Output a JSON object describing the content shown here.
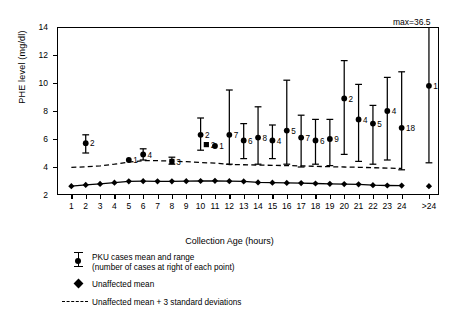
{
  "chart_data": {
    "type": "scatter",
    "title": "",
    "xlabel": "Collection Age (hours)",
    "ylabel": "PHE level (mg/dl)",
    "ylim": [
      2,
      14
    ],
    "y_ticks": [
      2,
      4,
      6,
      8,
      10,
      12,
      14
    ],
    "grid": false,
    "legend_position": "below-plot-left",
    "annotations": [
      {
        "name": "max-label",
        "text": "max=36.5",
        "x_category": ">24",
        "note": "upper range of >24 group extends to 36.5, clipped at axis top"
      }
    ],
    "categories": [
      "1",
      "2",
      "3",
      "4",
      "5",
      "6",
      "7",
      "8",
      "9",
      "10",
      "11",
      "12",
      "13",
      "14",
      "15",
      "16",
      "17",
      "18",
      "19",
      "20",
      "21",
      "22",
      "23",
      "24",
      ">24"
    ],
    "series": [
      {
        "name": "PKU cases mean and range",
        "marker": "circle-with-range-bars",
        "label_note": "number of cases at right of each point",
        "points": [
          {
            "x": "1",
            "mean": null,
            "low": null,
            "high": null,
            "n": null
          },
          {
            "x": "2",
            "mean": 5.7,
            "low": 5.0,
            "high": 6.3,
            "n": "2"
          },
          {
            "x": "3",
            "mean": null,
            "low": null,
            "high": null,
            "n": null
          },
          {
            "x": "4",
            "mean": null,
            "low": null,
            "high": null,
            "n": null
          },
          {
            "x": "5",
            "mean": 4.5,
            "low": 4.5,
            "high": 4.5,
            "n": "1"
          },
          {
            "x": "6",
            "mean": 4.9,
            "low": 4.5,
            "high": 5.3,
            "n": "4"
          },
          {
            "x": "7",
            "mean": null,
            "low": null,
            "high": null,
            "n": null
          },
          {
            "x": "8",
            "mean": 4.4,
            "low": 4.2,
            "high": 4.7,
            "n": "3",
            "marker": "square"
          },
          {
            "x": "9",
            "mean": null,
            "low": null,
            "high": null,
            "n": null
          },
          {
            "x": "10",
            "mean": 6.3,
            "low": 5.2,
            "high": 7.5,
            "n": "2"
          },
          {
            "x": "10.4",
            "mean": 5.6,
            "low": 5.6,
            "high": 5.6,
            "n": "2",
            "marker": "square"
          },
          {
            "x": "11",
            "mean": 5.5,
            "low": 5.5,
            "high": 5.5,
            "n": "1"
          },
          {
            "x": "12",
            "mean": 6.3,
            "low": 4.2,
            "high": 9.5,
            "n": "7"
          },
          {
            "x": "13",
            "mean": 5.9,
            "low": 4.6,
            "high": 7.1,
            "n": "6"
          },
          {
            "x": "14",
            "mean": 6.1,
            "low": 4.2,
            "high": 8.3,
            "n": "8"
          },
          {
            "x": "15",
            "mean": 5.9,
            "low": 4.6,
            "high": 7.0,
            "n": "4"
          },
          {
            "x": "16",
            "mean": 6.6,
            "low": 4.2,
            "high": 10.2,
            "n": "5"
          },
          {
            "x": "17",
            "mean": 6.1,
            "low": 4.0,
            "high": 7.7,
            "n": "7"
          },
          {
            "x": "18",
            "mean": 5.9,
            "low": 4.2,
            "high": 7.4,
            "n": "6"
          },
          {
            "x": "19",
            "mean": 6.0,
            "low": 4.1,
            "high": 7.4,
            "n": "9"
          },
          {
            "x": "20",
            "mean": 8.9,
            "low": 4.9,
            "high": 11.6,
            "n": "2"
          },
          {
            "x": "21",
            "mean": 7.4,
            "low": 4.4,
            "high": 9.9,
            "n": "4"
          },
          {
            "x": "22",
            "mean": 7.1,
            "low": 4.2,
            "high": 8.4,
            "n": "5"
          },
          {
            "x": "23",
            "mean": 8.0,
            "low": 4.5,
            "high": 10.4,
            "n": "4"
          },
          {
            "x": "24",
            "mean": 6.8,
            "low": 3.8,
            "high": 10.8,
            "n": "18"
          },
          {
            "x": ">24",
            "mean": 9.8,
            "low": 4.3,
            "high": 14.0,
            "n": "188"
          }
        ]
      },
      {
        "name": "Unaffected mean",
        "marker": "diamond",
        "values": [
          2.63,
          2.72,
          2.79,
          2.88,
          2.98,
          2.99,
          2.98,
          2.98,
          2.99,
          3.0,
          3.01,
          2.99,
          2.97,
          2.9,
          2.88,
          2.86,
          2.85,
          2.82,
          2.8,
          2.78,
          2.76,
          2.7,
          2.68,
          2.67,
          2.63
        ]
      },
      {
        "name": "Unaffected mean + 3 standard deviations",
        "marker": "dashed-line",
        "values": [
          3.97,
          4.01,
          4.08,
          4.2,
          4.35,
          4.45,
          4.45,
          4.42,
          4.38,
          4.32,
          4.28,
          4.18,
          4.16,
          4.14,
          4.12,
          4.1,
          4.08,
          4.05,
          4.02,
          4.0,
          3.98,
          3.95,
          3.92,
          3.9,
          null
        ]
      }
    ]
  },
  "axes": {
    "y_title": "PHE level (mg/dl)",
    "x_title": "Collection Age (hours)",
    "y_tick_labels": [
      "14",
      "12",
      "10",
      "8",
      "6",
      "4",
      "2"
    ],
    "x_tick_labels": [
      "1",
      "2",
      "3",
      "4",
      "5",
      "6",
      "7",
      "8",
      "9",
      "10",
      "11",
      "12",
      "13",
      "14",
      "15",
      "16",
      "17",
      "18",
      "19",
      "20",
      "21",
      "22",
      "23",
      "24",
      ">24"
    ]
  },
  "annotation": {
    "max_label": "max=36.5"
  },
  "legend": {
    "items": [
      {
        "marker": "pku-range-marker",
        "line1": "PKU cases mean and range",
        "line2": "(number of cases at right of each point)"
      },
      {
        "marker": "diamond-marker",
        "line1": "Unaffected mean",
        "line2": ""
      },
      {
        "marker": "dashed-line-marker",
        "line1": "Unaffected mean + 3 standard deviations",
        "line2": ""
      }
    ]
  }
}
